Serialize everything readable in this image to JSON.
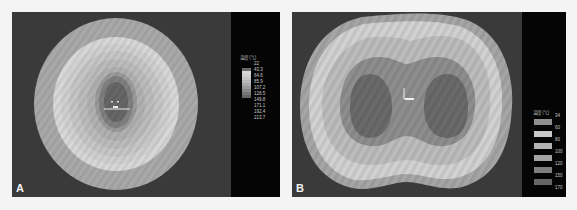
{
  "figure": {
    "panels": [
      {
        "label": "A",
        "shape": "ellipse",
        "legend": {
          "title": "温度 (℃)",
          "values": [
            "22",
            "43.3",
            "64.6",
            "85.9",
            "107.2",
            "128.5",
            "149.8",
            "171.1",
            "192.4",
            "213.7"
          ]
        }
      },
      {
        "label": "B",
        "shape": "peanut",
        "legend": {
          "title": "温度 (℃)",
          "values": [
            "34",
            "60",
            "80",
            "100",
            "120",
            "150",
            "170"
          ]
        }
      }
    ]
  },
  "colors": {
    "background": "#3a3a3a",
    "legend_band": "#050505",
    "contour_outer": "#a9a9a9",
    "contour_light": "#d6d6d6",
    "contour_mid": "#bdbdbd",
    "contour_dark": "#7b7b7b",
    "contour_core": "#5f5f5f"
  }
}
